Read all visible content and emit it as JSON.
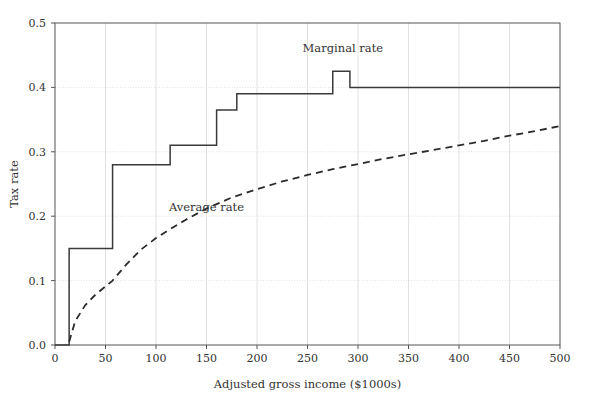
{
  "chart_data": {
    "type": "line",
    "title": "",
    "xlabel": "Adjusted gross income ($1000s)",
    "ylabel": "Tax rate",
    "xlim": [
      0,
      500
    ],
    "ylim": [
      0.0,
      0.5
    ],
    "xticks": [
      0,
      50,
      100,
      150,
      200,
      250,
      300,
      350,
      400,
      450,
      500
    ],
    "xtick_labels": [
      "0",
      "50",
      "100",
      "150",
      "200",
      "250",
      "300",
      "350",
      "400",
      "450",
      "500"
    ],
    "yticks": [
      0.0,
      0.1,
      0.2,
      0.3,
      0.4,
      0.5
    ],
    "ytick_labels": [
      "0.0",
      "0.1",
      "0.2",
      "0.3",
      "0.4",
      "0.5"
    ],
    "grid": true,
    "grid_color": "#d9d9d9",
    "frame_color": "#555555",
    "background": "#ffffff",
    "legend_position": "inline-annotations",
    "series": [
      {
        "name": "Marginal rate",
        "style": "step",
        "linestyle": "solid",
        "color": "#3a3a3a",
        "label_text": "Marginal rate",
        "label_x": 285,
        "label_y": 0.455,
        "breakpoints": [
          0,
          14,
          57,
          114,
          160,
          180,
          275,
          292,
          500
        ],
        "rates": [
          0.0,
          0.15,
          0.28,
          0.31,
          0.365,
          0.39,
          0.425,
          0.4,
          0.4
        ]
      },
      {
        "name": "Average rate",
        "style": "curve",
        "linestyle": "dashed",
        "color": "#2b2b2b",
        "label_text": "Average rate",
        "label_x": 150,
        "label_y": 0.208,
        "x": [
          14,
          20,
          30,
          40,
          50,
          57,
          70,
          85,
          100,
          114,
          130,
          150,
          175,
          200,
          225,
          250,
          275,
          300,
          325,
          350,
          375,
          400,
          425,
          450,
          475,
          500
        ],
        "y": [
          0.005,
          0.037,
          0.062,
          0.078,
          0.091,
          0.1,
          0.124,
          0.148,
          0.166,
          0.18,
          0.195,
          0.212,
          0.229,
          0.242,
          0.254,
          0.264,
          0.273,
          0.281,
          0.289,
          0.296,
          0.303,
          0.31,
          0.317,
          0.325,
          0.332,
          0.34
        ]
      }
    ]
  },
  "axes": {
    "x_title": "Adjusted gross income ($1000s)",
    "y_title": "Tax rate"
  },
  "annotations": {
    "marginal": "Marginal rate",
    "average": "Average rate"
  }
}
